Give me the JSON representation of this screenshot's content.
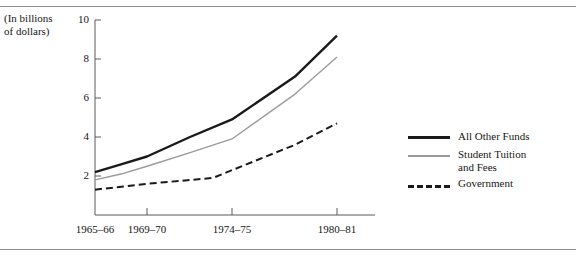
{
  "figure": {
    "units_note": "(In billions\nof dollars)"
  },
  "chart_data": {
    "type": "line",
    "title": "",
    "subtitle": "",
    "xlabel": "",
    "ylabel": "(In billions of dollars)",
    "categories": [
      "1965-66",
      "1969-70",
      "1974-75",
      "1980-81"
    ],
    "x_tick_labels": [
      "1965–66",
      "1969–70",
      "1974–75",
      "1980–81"
    ],
    "y_tick_labels": [
      "2",
      "4",
      "6",
      "8",
      "10"
    ],
    "y_ticks": [
      2,
      4,
      6,
      8,
      10
    ],
    "ylim": [
      0,
      10
    ],
    "grid": false,
    "legend_position": "right",
    "series": [
      {
        "name": "All Other Funds",
        "label": "All Other Funds",
        "style": "solid-thick",
        "color": "#1a1a1a",
        "x": [
          "1965-66",
          "1969-70",
          "1974-75",
          "1980-81"
        ],
        "values": [
          2.2,
          3.0,
          4.9,
          9.2
        ],
        "intermediate_points": [
          {
            "x": "1965-66",
            "y": 2.2
          },
          {
            "x": "1967",
            "y": 2.6
          },
          {
            "x": "1969-70",
            "y": 3.0
          },
          {
            "x": "1972",
            "y": 4.0
          },
          {
            "x": "1974-75",
            "y": 4.9
          },
          {
            "x": "1978",
            "y": 7.1
          },
          {
            "x": "1980-81",
            "y": 9.2
          }
        ]
      },
      {
        "name": "Student Tuition and Fees",
        "label": "Student Tuition\nand Fees",
        "style": "solid-thin",
        "color": "#9a9a9a",
        "x": [
          "1965-66",
          "1969-70",
          "1974-75",
          "1980-81"
        ],
        "values": [
          1.8,
          2.5,
          3.9,
          8.1
        ],
        "intermediate_points": [
          {
            "x": "1965-66",
            "y": 1.8
          },
          {
            "x": "1967",
            "y": 2.1
          },
          {
            "x": "1969-70",
            "y": 2.5
          },
          {
            "x": "1972",
            "y": 3.2
          },
          {
            "x": "1974-75",
            "y": 3.9
          },
          {
            "x": "1978",
            "y": 6.2
          },
          {
            "x": "1980-81",
            "y": 8.1
          }
        ]
      },
      {
        "name": "Government",
        "label": "Government",
        "style": "dashed",
        "color": "#1a1a1a",
        "x": [
          "1965-66",
          "1969-70",
          "1974-75",
          "1980-81"
        ],
        "values": [
          1.3,
          1.6,
          1.9,
          4.7
        ],
        "intermediate_points": [
          {
            "x": "1965-66",
            "y": 1.3
          },
          {
            "x": "1969-70",
            "y": 1.6
          },
          {
            "x": "1973",
            "y": 1.9
          },
          {
            "x": "1974-75",
            "y": 2.3
          },
          {
            "x": "1978",
            "y": 3.6
          },
          {
            "x": "1980-81",
            "y": 4.7
          }
        ]
      }
    ]
  },
  "legend": {
    "items": [
      {
        "label": "All Other Funds",
        "style": "solid-thick"
      },
      {
        "label": "Student Tuition\nand Fees",
        "style": "solid-thin"
      },
      {
        "label": "Government",
        "style": "dashed"
      }
    ]
  }
}
